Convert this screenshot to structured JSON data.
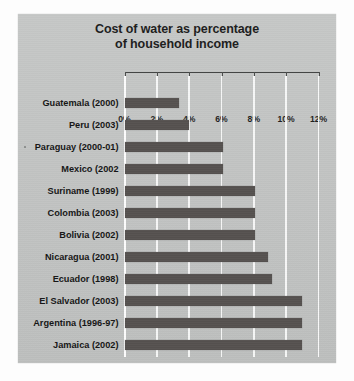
{
  "chart_data": {
    "type": "bar",
    "orientation": "horizontal",
    "title": "Cost of water as percentage of household income",
    "title_lines": [
      "Cost of water as percentage",
      "of household income"
    ],
    "xlabel": "",
    "ylabel": "",
    "xlim": [
      0,
      12
    ],
    "xticks": [
      0,
      2,
      4,
      6,
      8,
      10,
      12
    ],
    "xtick_labels": [
      "0%",
      "2%",
      "4%",
      "6%",
      "8%",
      "10%",
      "12%"
    ],
    "grid": "vertical",
    "legend": "none",
    "units": "percent",
    "categories": [
      "Guatemala (2000)",
      "Peru (2003)",
      "Paraguay (2000-01)",
      "Mexico (2002",
      "Suriname (1999)",
      "Colombia (2003)",
      "Bolivia (2002)",
      "Nicaragua (2001)",
      "Ecuador (1998)",
      "El Salvador (2003)",
      "Argentina (1996-97)",
      "Jamaica (2002)"
    ],
    "values": [
      3.4,
      4.0,
      6.1,
      6.1,
      8.1,
      8.1,
      8.1,
      8.9,
      9.1,
      11.0,
      11.0,
      11.0
    ],
    "bars": [
      {
        "label": "Guatemala (2000)",
        "value": 3.4
      },
      {
        "label": "Peru (2003)",
        "value": 4.0
      },
      {
        "label": "Paraguay (2000-01)",
        "value": 6.1
      },
      {
        "label": "Mexico (2002",
        "value": 6.1
      },
      {
        "label": "Suriname (1999)",
        "value": 8.1
      },
      {
        "label": "Colombia (2003)",
        "value": 8.1
      },
      {
        "label": "Bolivia (2002)",
        "value": 8.1
      },
      {
        "label": "Nicaragua (2001)",
        "value": 8.9
      },
      {
        "label": "Ecuador (1998)",
        "value": 9.1
      },
      {
        "label": "El Salvador (2003)",
        "value": 11.0
      },
      {
        "label": "Argentina (1996-97)",
        "value": 11.0
      },
      {
        "label": "Jamaica (2002)",
        "value": 11.0
      }
    ],
    "colors": {
      "bar": "#55514f",
      "panel_background": "#c3c5c4",
      "gridline": "#ffffff",
      "axis_line": "#3f4140",
      "text": "#151515"
    }
  }
}
